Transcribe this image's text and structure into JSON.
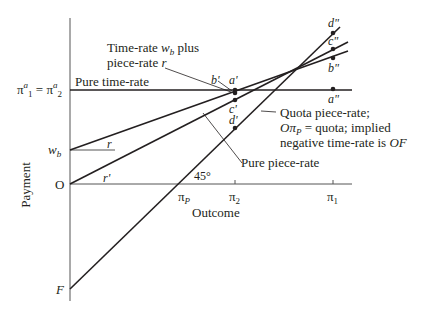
{
  "diagram": {
    "y_axis_label": "Payment",
    "x_axis_label": "Outcome",
    "y_ticks": {
      "pi_a": "π",
      "pi_a_sup": "a",
      "pi_a_sub1": "1",
      "eq": " = ",
      "pi_a_sub2": "2",
      "w_b": "w",
      "w_b_sub": "b",
      "origin": "O",
      "F": "F"
    },
    "x_ticks": {
      "pi_p": "π",
      "pi_p_sub": "P",
      "pi_2": "π",
      "pi_2_sub": "2",
      "pi_1": "π",
      "pi_1_sub": "1"
    },
    "angle_label": "45°",
    "slope_labels": {
      "r": "r",
      "r_prime": "r'"
    },
    "line_labels": {
      "pure_time_rate": "Pure time-rate",
      "time_rate_plus_line1_a": "Time-rate ",
      "time_rate_plus_line1_w": "w",
      "time_rate_plus_line1_sub": "b",
      "time_rate_plus_line1_b": " plus",
      "time_rate_plus_line2_a": "piece-rate ",
      "time_rate_plus_line2_r": "r",
      "quota_line1": "Quota piece-rate;",
      "quota_line2_O": "Oπ",
      "quota_line2_sub": "P",
      "quota_line2_rest": " = quota; implied",
      "quota_line3_a": "negative time-rate is ",
      "quota_line3_OF": "OF",
      "pure_piece_rate": "Pure piece-rate"
    },
    "points": {
      "a_prime": "a'",
      "b_prime": "b'",
      "c_prime": "c'",
      "d_prime": "d'",
      "a_dprime": "a\"",
      "b_dprime": "b\"",
      "c_dprime": "c\"",
      "d_dprime": "d\""
    }
  }
}
